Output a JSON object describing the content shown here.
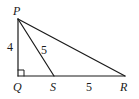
{
  "diagram": {
    "type": "right-triangle-geometry",
    "points": {
      "P": {
        "label": "P",
        "x": 18,
        "y": 19
      },
      "Q": {
        "label": "Q",
        "x": 18,
        "y": 76
      },
      "S": {
        "label": "S",
        "x": 54,
        "y": 76
      },
      "R": {
        "label": "R",
        "x": 125,
        "y": 76
      }
    },
    "segments": [
      {
        "from": "P",
        "to": "Q",
        "length_label": "4"
      },
      {
        "from": "P",
        "to": "S",
        "length_label": "5"
      },
      {
        "from": "S",
        "to": "R",
        "length_label": "5"
      },
      {
        "from": "P",
        "to": "R",
        "length_label": ""
      },
      {
        "from": "Q",
        "to": "S",
        "length_label": ""
      }
    ],
    "right_angle_at": "Q",
    "colors": {
      "stroke": "#1a1a1a",
      "background": "#ffffff"
    }
  }
}
